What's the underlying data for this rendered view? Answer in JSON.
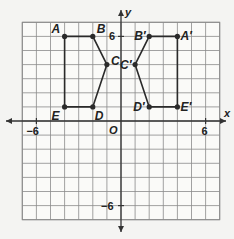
{
  "diagram": {
    "type": "coordinate-plane-reflection",
    "grid": {
      "min": -7,
      "max": 7,
      "origin_px": [
        121,
        121
      ],
      "unit_px": 14.1
    },
    "axes": {
      "x_label": "x",
      "y_label": "y",
      "origin_label": "O",
      "ticks": [
        {
          "axis": "x",
          "value": -6,
          "label": "−6"
        },
        {
          "axis": "x",
          "value": 6,
          "label": "6"
        },
        {
          "axis": "y",
          "value": 6,
          "label": "6"
        },
        {
          "axis": "y",
          "value": -6,
          "label": "−6"
        }
      ]
    },
    "figures": [
      {
        "name": "original",
        "points": [
          {
            "label": "A",
            "x": -4,
            "y": 6
          },
          {
            "label": "B",
            "x": -2,
            "y": 6
          },
          {
            "label": "C",
            "x": -1,
            "y": 4
          },
          {
            "label": "D",
            "x": -2,
            "y": 1
          },
          {
            "label": "E",
            "x": -4,
            "y": 1
          }
        ]
      },
      {
        "name": "image",
        "points": [
          {
            "label": "A′",
            "x": 4,
            "y": 6
          },
          {
            "label": "B′",
            "x": 2,
            "y": 6
          },
          {
            "label": "C′",
            "x": 1,
            "y": 4
          },
          {
            "label": "D′",
            "x": 2,
            "y": 1
          },
          {
            "label": "E′",
            "x": 4,
            "y": 1
          }
        ]
      }
    ],
    "colors": {
      "grid": "#8a8a8a",
      "axis": "#333333",
      "figure": "#2a2a2a",
      "background": "#f4f4f2"
    }
  }
}
